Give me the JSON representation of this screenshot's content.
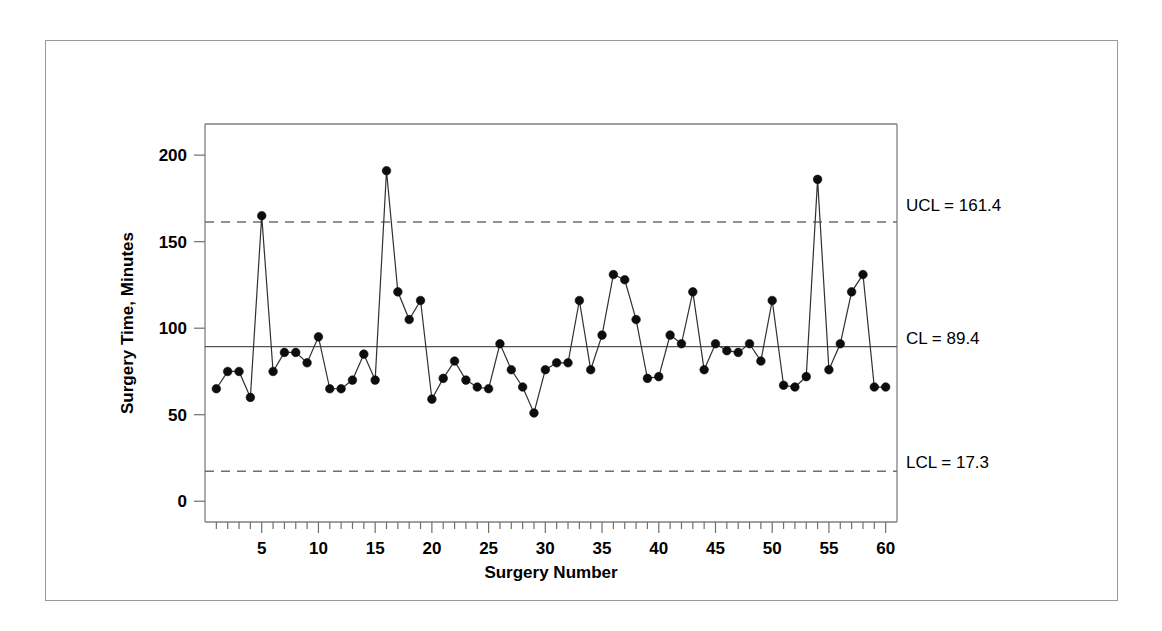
{
  "figure": {
    "background_color": "#ffffff",
    "frame_color": "#9a9a9a",
    "axis_color": "#808080",
    "marker_color": "#0d0d0d",
    "line_color": "#303030",
    "limit_color": "#6f6f6f"
  },
  "chart_data": {
    "type": "line",
    "title": "",
    "subtitle": "",
    "xlabel": "Surgery Number",
    "ylabel": "Surgery Time, Minutes",
    "xlim": [
      0,
      61
    ],
    "ylim": [
      -12,
      218
    ],
    "grid": false,
    "legend": "none",
    "x_ticks_major": [
      5,
      10,
      15,
      20,
      25,
      30,
      35,
      40,
      45,
      50,
      55,
      60
    ],
    "x_tick_labels": [
      "5",
      "10",
      "15",
      "20",
      "25",
      "30",
      "35",
      "40",
      "45",
      "50",
      "55",
      "60"
    ],
    "x_minor_tick_interval": 1,
    "y_ticks": [
      0,
      50,
      100,
      150,
      200
    ],
    "y_tick_labels": [
      "0",
      "50",
      "100",
      "150",
      "200"
    ],
    "x": [
      1,
      2,
      3,
      4,
      5,
      6,
      7,
      8,
      9,
      10,
      11,
      12,
      13,
      14,
      15,
      16,
      17,
      18,
      19,
      20,
      21,
      22,
      23,
      24,
      25,
      26,
      27,
      28,
      29,
      30,
      31,
      32,
      33,
      34,
      35,
      36,
      37,
      38,
      39,
      40,
      41,
      42,
      43,
      44,
      45,
      46,
      47,
      48,
      49,
      50,
      51,
      52,
      53,
      54,
      55,
      56,
      57,
      58,
      59,
      60
    ],
    "values": [
      65,
      75,
      75,
      60,
      165,
      75,
      86,
      86,
      80,
      95,
      65,
      65,
      70,
      85,
      70,
      191,
      121,
      105,
      116,
      59,
      71,
      81,
      70,
      66,
      65,
      91,
      76,
      66,
      51,
      76,
      80,
      80,
      116,
      76,
      96,
      131,
      128,
      105,
      71,
      72,
      96,
      91,
      121,
      76,
      91,
      87,
      86,
      91,
      81,
      116,
      67,
      66,
      72,
      186,
      76,
      91,
      121,
      131,
      66,
      66
    ],
    "series": [
      {
        "name": "Surgery Time",
        "marker": "filled-circle",
        "values": [
          65,
          75,
          75,
          60,
          165,
          75,
          86,
          86,
          80,
          95,
          65,
          65,
          70,
          85,
          70,
          191,
          121,
          105,
          116,
          59,
          71,
          81,
          70,
          66,
          65,
          91,
          76,
          66,
          51,
          76,
          80,
          80,
          116,
          76,
          96,
          131,
          128,
          105,
          71,
          72,
          96,
          91,
          121,
          76,
          91,
          87,
          86,
          91,
          81,
          116,
          67,
          66,
          72,
          186,
          76,
          91,
          121,
          131,
          66,
          66
        ]
      }
    ],
    "control_limits": {
      "ucl": {
        "value": 161.4,
        "label": "UCL = 161.4",
        "style": "dashed"
      },
      "cl": {
        "value": 89.4,
        "label": "CL = 89.4",
        "style": "solid"
      },
      "lcl": {
        "value": 17.3,
        "label": "LCL = 17.3",
        "style": "dashed"
      }
    },
    "annotations": [
      {
        "text": "UCL = 161.4",
        "at_y": 161.4
      },
      {
        "text": "CL = 89.4",
        "at_y": 89.4
      },
      {
        "text": "LCL = 17.3",
        "at_y": 17.3
      }
    ]
  },
  "labels": {
    "ucl": "UCL = 161.4",
    "cl": "CL = 89.4",
    "lcl": "LCL = 17.3",
    "x_axis_title": "Surgery Number",
    "y_axis_title": "Surgery Time, Minutes"
  }
}
